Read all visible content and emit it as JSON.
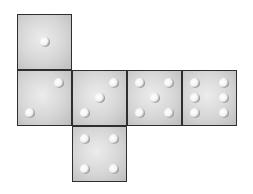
{
  "diagram": {
    "type": "cube-net",
    "faces": [
      {
        "id": "top",
        "value": 1,
        "x": 17,
        "y": 14,
        "pips": [
          [
            50,
            50
          ]
        ]
      },
      {
        "id": "left",
        "value": 2,
        "x": 17,
        "y": 70,
        "pips": [
          [
            78,
            22
          ],
          [
            22,
            78
          ]
        ]
      },
      {
        "id": "center",
        "value": 3,
        "x": 72,
        "y": 70,
        "pips": [
          [
            78,
            22
          ],
          [
            50,
            50
          ],
          [
            22,
            78
          ]
        ]
      },
      {
        "id": "right1",
        "value": 5,
        "x": 127,
        "y": 70,
        "pips": [
          [
            22,
            22
          ],
          [
            78,
            22
          ],
          [
            50,
            50
          ],
          [
            22,
            78
          ],
          [
            78,
            78
          ]
        ]
      },
      {
        "id": "right2",
        "value": 6,
        "x": 182,
        "y": 70,
        "pips": [
          [
            22,
            22
          ],
          [
            78,
            22
          ],
          [
            22,
            50
          ],
          [
            78,
            50
          ],
          [
            22,
            78
          ],
          [
            78,
            78
          ]
        ]
      },
      {
        "id": "bottom",
        "value": 4,
        "x": 72,
        "y": 126,
        "pips": [
          [
            22,
            22
          ],
          [
            78,
            22
          ],
          [
            22,
            78
          ],
          [
            78,
            78
          ]
        ]
      }
    ],
    "colors": {
      "border": "#2e2e2e",
      "face": "#d6d6d6",
      "pip": "#ffffff"
    }
  }
}
